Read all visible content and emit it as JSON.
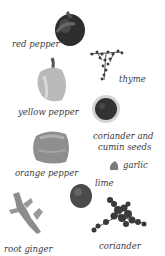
{
  "items": [
    {
      "id": "red-pepper",
      "label": "red pepper"
    },
    {
      "id": "thyme",
      "label": "thyme"
    },
    {
      "id": "yellow-pepper",
      "label": "yellow pepper"
    },
    {
      "id": "coriander-cumin",
      "label_line1": "coriander and",
      "label_line2": "cumin seeds"
    },
    {
      "id": "orange-pepper",
      "label": "orange pepper"
    },
    {
      "id": "garlic",
      "label": "garlic"
    },
    {
      "id": "lime",
      "label": "lime"
    },
    {
      "id": "root-ginger",
      "label": "root ginger"
    },
    {
      "id": "coriander",
      "label": "coriander"
    }
  ],
  "colors": {
    "background": "#ffffff",
    "text": "#3a3a3a",
    "dark": "#2a2a2a",
    "mid": "#7a7a7a",
    "light": "#b8b8b8"
  }
}
